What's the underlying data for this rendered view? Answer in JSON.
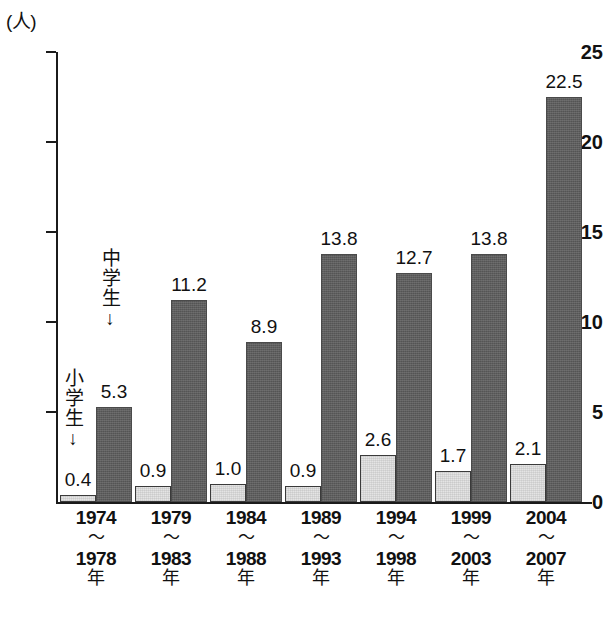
{
  "chart_data": {
    "type": "bar",
    "title": "",
    "xlabel": "",
    "ylabel": "(人)",
    "unit_label": "(人)",
    "ylim": [
      0,
      25
    ],
    "yticks": [
      0,
      5,
      10,
      15,
      20,
      25
    ],
    "grid": false,
    "legend_position": "inline-annotation",
    "categories": [
      "1974\n〜\n1978\n年",
      "1979\n〜\n1983\n年",
      "1984\n〜\n1988\n年",
      "1989\n〜\n1993\n年",
      "1994\n〜\n1998\n年",
      "1999\n〜\n2003\n年",
      "2004\n〜\n2007\n年"
    ],
    "category_parts": [
      {
        "start": "1974",
        "sep": "〜",
        "end": "1978",
        "suffix": "年"
      },
      {
        "start": "1979",
        "sep": "〜",
        "end": "1983",
        "suffix": "年"
      },
      {
        "start": "1984",
        "sep": "〜",
        "end": "1988",
        "suffix": "年"
      },
      {
        "start": "1989",
        "sep": "〜",
        "end": "1993",
        "suffix": "年"
      },
      {
        "start": "1994",
        "sep": "〜",
        "end": "1998",
        "suffix": "年"
      },
      {
        "start": "1999",
        "sep": "〜",
        "end": "2003",
        "suffix": "年"
      },
      {
        "start": "2004",
        "sep": "〜",
        "end": "2007",
        "suffix": "年"
      }
    ],
    "series": [
      {
        "name": "小学生",
        "color": "#e4e4e4",
        "values": [
          0.4,
          0.9,
          1.0,
          0.9,
          2.6,
          1.7,
          2.1
        ],
        "labels": [
          "0.4",
          "0.9",
          "1.0",
          "0.9",
          "2.6",
          "1.7",
          "2.1"
        ]
      },
      {
        "name": "中学生",
        "color": "#5e5e5e",
        "values": [
          5.3,
          11.2,
          8.9,
          13.8,
          12.7,
          13.8,
          22.5
        ],
        "labels": [
          "5.3",
          "11.2",
          "8.9",
          "13.8",
          "12.7",
          "13.8",
          "22.5"
        ]
      }
    ],
    "annotations": [
      {
        "text": "小学生",
        "arrow": "↓",
        "points_to": "elementary-bar-1"
      },
      {
        "text": "中学生",
        "arrow": "↓",
        "points_to": "junior-bar-1"
      }
    ]
  },
  "axis": {
    "ytick_labels": [
      "0",
      "5",
      "10",
      "15",
      "20",
      "25"
    ]
  },
  "colors": {
    "elementary": "#e4e4e4",
    "junior": "#5e5e5e",
    "axis": "#1b1b1b",
    "text": "#111111",
    "background": "#ffffff"
  }
}
